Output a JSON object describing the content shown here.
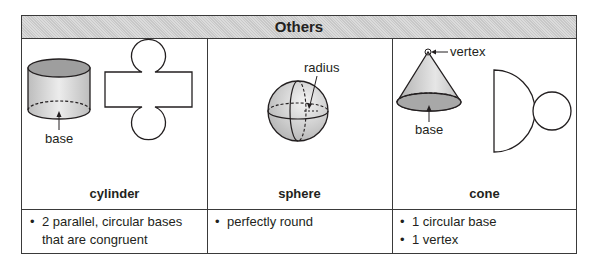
{
  "table": {
    "title": "Others",
    "columns": [
      {
        "name": "cylinder",
        "labels": {
          "base": "base"
        },
        "properties": [
          "2 parallel, circular bases",
          "that are congruent"
        ]
      },
      {
        "name": "sphere",
        "labels": {
          "radius": "radius"
        },
        "properties": [
          "perfectly round"
        ]
      },
      {
        "name": "cone",
        "labels": {
          "vertex": "vertex",
          "base": "base"
        },
        "properties": [
          "1 circular base",
          "1 vertex"
        ]
      }
    ]
  },
  "colors": {
    "border": "#3a3a3a",
    "header_fill": "#c8c8c8",
    "shape_fill": "#d0d0d0",
    "text": "#231f20"
  }
}
